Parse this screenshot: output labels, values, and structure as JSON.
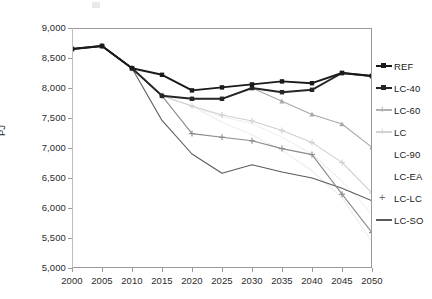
{
  "chart_data": {
    "type": "line",
    "title": "",
    "xlabel": "",
    "ylabel": "PJ",
    "x": [
      2000,
      2005,
      2010,
      2015,
      2020,
      2025,
      2030,
      2035,
      2040,
      2045,
      2050
    ],
    "xlim": [
      2000,
      2050
    ],
    "ylim": [
      5000,
      9000
    ],
    "ytick_labels": [
      "9,000",
      "8,500",
      "8,000",
      "7,500",
      "7,000",
      "6,500",
      "6,000",
      "5,500",
      "5,000"
    ],
    "ytick_values": [
      9000,
      8500,
      8000,
      7500,
      7000,
      6500,
      6000,
      5500,
      5000
    ],
    "xtick_labels": [
      "2000",
      "2005",
      "2010",
      "2015",
      "2020",
      "2025",
      "2030",
      "2035",
      "2040",
      "2045",
      "2050"
    ],
    "grid": false,
    "legend_position": "right",
    "series": [
      {
        "name": "REF",
        "color": "#1a1a1a",
        "marker": "square",
        "values": [
          8650,
          8700,
          8330,
          8220,
          7960,
          8010,
          8060,
          8110,
          8080,
          8250,
          8200
        ]
      },
      {
        "name": "LC-40",
        "color": "#262626",
        "marker": "square",
        "values": [
          8650,
          8700,
          8330,
          7870,
          7820,
          7820,
          8000,
          7930,
          7970,
          8250,
          8200
        ]
      },
      {
        "name": "LC-60",
        "color": "#a8a8a8",
        "marker": "triangle",
        "values": [
          8650,
          8700,
          8330,
          7870,
          7820,
          7820,
          8000,
          7780,
          7560,
          7400,
          7010
        ]
      },
      {
        "name": "LC",
        "color": "#cfcfcf",
        "marker": "plus",
        "values": [
          8650,
          8700,
          8330,
          7870,
          7700,
          7550,
          7450,
          7290,
          7090,
          6760,
          6250
        ]
      },
      {
        "name": "LC-90",
        "color": "#ededed",
        "marker": "none",
        "values": [
          8650,
          8700,
          8330,
          7870,
          7700,
          7430,
          7220,
          6960,
          6620,
          6170,
          5440
        ]
      },
      {
        "name": "LC-EA",
        "color": "#f0f0f0",
        "marker": "none",
        "values": [
          8650,
          8700,
          8330,
          7870,
          7690,
          7520,
          7410,
          7180,
          6900,
          6450,
          5900
        ]
      },
      {
        "name": "LC-LC",
        "color": "#8a8a8a",
        "marker": "plus",
        "values": [
          8650,
          8700,
          8330,
          7870,
          7240,
          7180,
          7120,
          6990,
          6890,
          6230,
          5590
        ]
      },
      {
        "name": "LC-SO",
        "color": "#5a5a5a",
        "marker": "none",
        "values": [
          8650,
          8700,
          8330,
          7460,
          6900,
          6580,
          6720,
          6600,
          6500,
          6330,
          6120
        ]
      }
    ]
  },
  "legend": {
    "items": [
      {
        "label": "REF",
        "style": "line-square",
        "color": "#1a1a1a"
      },
      {
        "label": "LC-40",
        "style": "line-square",
        "color": "#262626"
      },
      {
        "label": "LC-60",
        "style": "line-plus",
        "color": "#b0b0b0"
      },
      {
        "label": "LC",
        "style": "line-plus",
        "color": "#d2d2d2"
      },
      {
        "label": "LC-90",
        "style": "none",
        "color": "#f2f2f2"
      },
      {
        "label": "LC-EA",
        "style": "none",
        "color": "#f4f4f4"
      },
      {
        "label": "LC-LC",
        "style": "plus",
        "color": "#6e6e6e"
      },
      {
        "label": "LC-SO",
        "style": "line",
        "color": "#5a5a5a"
      }
    ]
  }
}
